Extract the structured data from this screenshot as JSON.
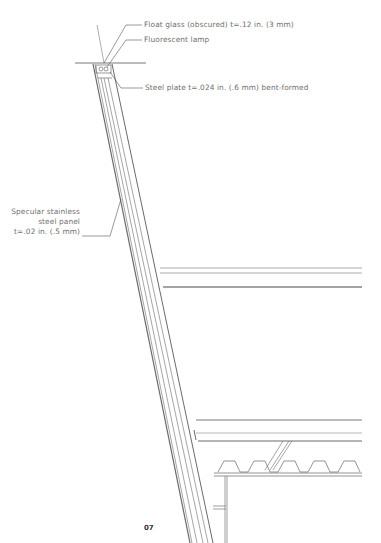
{
  "figure": {
    "type": "architectural-section-detail",
    "callouts": [
      {
        "id": "float-glass",
        "text": "Float glass (obscured) t=.12 in. (3 mm)"
      },
      {
        "id": "fluorescent-lamp",
        "text": "Fluorescent lamp"
      },
      {
        "id": "steel-plate",
        "text": "Steel plate t=.024 in. (.6 mm) bent-formed"
      },
      {
        "id": "stainless-panel",
        "lines": [
          "Specular stainless",
          "steel panel",
          "t=.02 in. (.5 mm)"
        ]
      }
    ],
    "page_number": "07"
  },
  "colors": {
    "line": "#6a6a6a",
    "line_dark": "#333333",
    "text": "#6f6f6f"
  }
}
